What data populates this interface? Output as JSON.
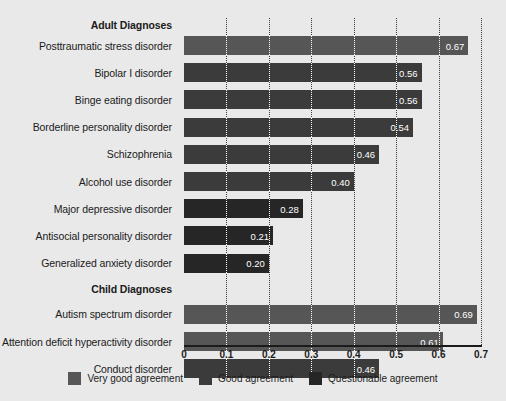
{
  "chart_data": {
    "type": "bar",
    "orientation": "horizontal",
    "title": "",
    "xlabel": "",
    "ylabel": "",
    "xlim": [
      0,
      0.7
    ],
    "xticks": [
      "0",
      "0.1",
      "0.2",
      "0.3",
      "0.4",
      "0.5",
      "0.6",
      "0.7"
    ],
    "xtick_values": [
      0,
      0.1,
      0.2,
      0.3,
      0.4,
      0.5,
      0.6,
      0.7
    ],
    "grid": true,
    "legend_position": "bottom",
    "sections": [
      {
        "label": "Adult Diagnoses",
        "categories": [
          "Posttraumatic stress disorder",
          "Bipolar I disorder",
          "Binge eating disorder",
          "Borderline personality disorder",
          "Schizophrenia",
          "Alcohol use disorder",
          "Major depressive disorder",
          "Antisocial personality disorder",
          "Generalized anxiety disorder"
        ],
        "values": [
          0.67,
          0.56,
          0.56,
          0.54,
          0.46,
          0.4,
          0.28,
          0.21,
          0.2
        ],
        "value_labels": [
          "0.67",
          "0.56",
          "0.56",
          "0.54",
          "0.46",
          "0.40",
          "0.28",
          "0.21",
          "0.20"
        ],
        "agreement": [
          "Very good agreement",
          "Good agreement",
          "Good agreement",
          "Good agreement",
          "Good agreement",
          "Good agreement",
          "Questionable agreement",
          "Questionable agreement",
          "Questionable agreement"
        ]
      },
      {
        "label": "Child Diagnoses",
        "categories": [
          "Autism spectrum disorder",
          "Attention deficit hyperactivity disorder",
          "Conduct disorder"
        ],
        "values": [
          0.69,
          0.61,
          0.46
        ],
        "value_labels": [
          "0.69",
          "0.61",
          "0.46"
        ],
        "agreement": [
          "Very good agreement",
          "Very good agreement",
          "Good agreement"
        ]
      }
    ],
    "legend": [
      {
        "label": "Very good agreement",
        "color": "#565656"
      },
      {
        "label": "Good agreement",
        "color": "#3b3b3b"
      },
      {
        "label": "Questionable agreement",
        "color": "#262626"
      }
    ],
    "colors": {
      "very_good": "#565656",
      "good": "#3b3b3b",
      "questionable": "#262626",
      "background": "#e9e9e9",
      "axis": "#1b1b1b",
      "gridline": "#3a3a3a",
      "bar_gridline": "#ffffff",
      "value_text": "#ffffff",
      "label_text": "#1b1b1b"
    }
  }
}
